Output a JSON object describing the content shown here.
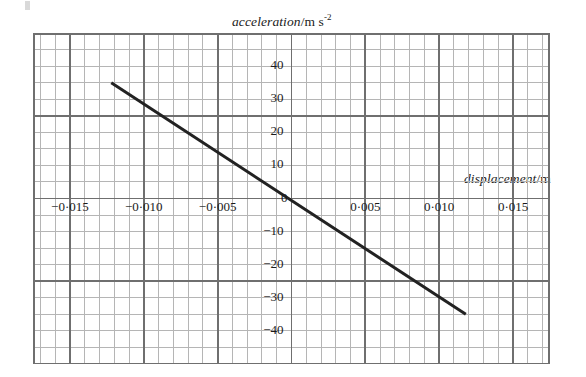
{
  "chart_data": {
    "type": "line",
    "title": "",
    "xlabel": "displacement/m",
    "ylabel": "acceleration/m s-2",
    "xlabel_parts": {
      "italic": "displacement",
      "upright": "/m"
    },
    "ylabel_parts": {
      "italic": "acceleration",
      "upright": "/m s",
      "superscript": "-2"
    },
    "xlim": [
      -0.0175,
      0.0175
    ],
    "ylim": [
      -50,
      50
    ],
    "xticks": [
      -0.015,
      -0.01,
      -0.005,
      0,
      0.005,
      0.01,
      0.015
    ],
    "xticklabels": [
      "−0·015",
      "−0·010",
      "−0·005",
      "0",
      "0·005",
      "0·010",
      "0·015"
    ],
    "yticks": [
      40,
      30,
      20,
      10,
      -10,
      -20,
      -30,
      -40
    ],
    "yticklabels": [
      "40",
      "30",
      "20",
      "10",
      "−10",
      "−20",
      "−30",
      "−40"
    ],
    "grid": true,
    "grid_minor_x": 0.001,
    "grid_minor_y": 5,
    "grid_major_x": 0.005,
    "grid_major_y": 25,
    "legend": "none",
    "series": [
      {
        "name": "acceleration vs displacement",
        "x": [
          -0.0122,
          0.0118
        ],
        "y": [
          35.0,
          -35.0
        ],
        "slope": -2916.7,
        "intercept": 0.0,
        "color": "#222222",
        "linewidth": 3
      }
    ],
    "colors": {
      "line": "#222222",
      "grid_minor": "#b5b5b5",
      "grid_major": "#6f6f6f",
      "axis": "#4d4d4d",
      "text": "#1a1a1a",
      "background": "#ffffff"
    }
  }
}
